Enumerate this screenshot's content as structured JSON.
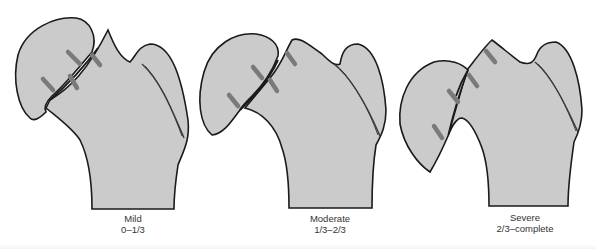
{
  "figure": {
    "panels": [
      {
        "id": "mild",
        "title": "Mild",
        "range": "0–1/3"
      },
      {
        "id": "moderate",
        "title": "Moderate",
        "range": "1/3–2/3"
      },
      {
        "id": "severe",
        "title": "Severe",
        "range": "2/3–complete"
      }
    ],
    "colors": {
      "bone_fill": "#cbcbcb",
      "outline": "#1a1a1a",
      "fracture_marks": "#7a7a7a",
      "background": "#ffffff"
    }
  }
}
